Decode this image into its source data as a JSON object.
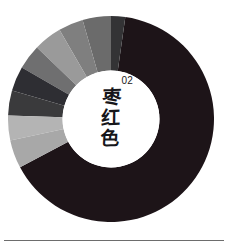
{
  "page": {
    "serial": "02",
    "background_color": "#ffffff",
    "divider_color": "#6d6d6d"
  },
  "center_label": {
    "serial": "02",
    "characters": [
      "枣",
      "红",
      "色"
    ],
    "full_text": "枣红色",
    "disc_color": "#ffffff",
    "text_color": "#16161a"
  },
  "chart_data": {
    "type": "pie",
    "subtitle": "02",
    "variant": "donut",
    "inner_radius_ratio": 0.47,
    "outer_radius_ratio": 1.0,
    "start_angle_deg": -90,
    "direction": "clockwise",
    "grid": false,
    "legend": "none",
    "xlabel": "",
    "ylabel": "",
    "categories": [
      "枣红色",
      "深灰 1",
      "中灰 1",
      "中灰 2",
      "浅灰 1",
      "深灰 2",
      "炭灰",
      "深灰 3",
      "浅灰 2",
      "浅灰 3"
    ],
    "values": [
      65,
      5,
      4,
      4,
      5,
      4,
      5,
      4,
      2,
      2
    ],
    "colors": [
      "#1d1418",
      "#333335",
      "#6b6b6b",
      "#7f7f7f",
      "#9a9a9a",
      "#6f6f70",
      "#2e2e33",
      "#3a3a3c",
      "#b4b4b4",
      "#a8a8a8"
    ],
    "segments": [
      {
        "label": "枣红色",
        "value": 65,
        "color": "#1d1418",
        "start_deg": 8,
        "end_deg": 242
      },
      {
        "label": "深灰 1",
        "value": 5,
        "color": "#333335",
        "start_deg": 0,
        "end_deg": 8
      },
      {
        "label": "中灰 1",
        "value": 4,
        "color": "#6b6b6b",
        "start_deg": 344,
        "end_deg": 360
      },
      {
        "label": "中灰 2",
        "value": 4,
        "color": "#7f7f7f",
        "start_deg": 330,
        "end_deg": 344
      },
      {
        "label": "浅灰 1",
        "value": 5,
        "color": "#9a9a9a",
        "start_deg": 314,
        "end_deg": 330
      },
      {
        "label": "深灰 2",
        "value": 4,
        "color": "#6f6f70",
        "start_deg": 300,
        "end_deg": 314
      },
      {
        "label": "炭灰",
        "value": 5,
        "color": "#2e2e33",
        "start_deg": 286,
        "end_deg": 300
      },
      {
        "label": "深灰 3",
        "value": 4,
        "color": "#3a3a3c",
        "start_deg": 272,
        "end_deg": 286
      },
      {
        "label": "浅灰 2",
        "value": 2,
        "color": "#b4b4b4",
        "start_deg": 258,
        "end_deg": 272
      },
      {
        "label": "浅灰 3",
        "value": 2,
        "color": "#a8a8a8",
        "start_deg": 242,
        "end_deg": 258
      }
    ]
  }
}
